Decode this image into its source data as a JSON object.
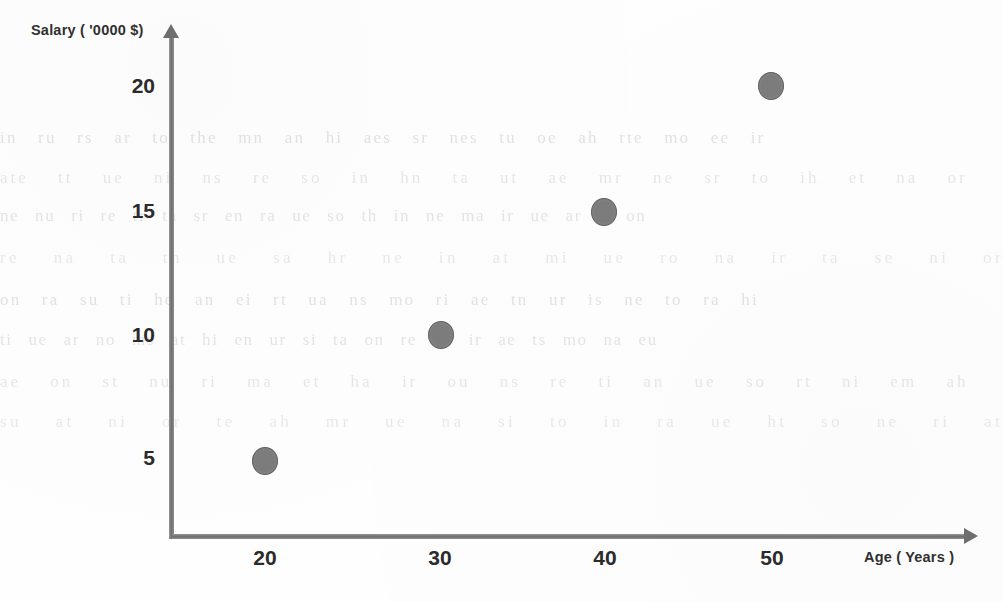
{
  "chart_data": {
    "type": "scatter",
    "title": "",
    "xlabel": "Age ( Years )",
    "ylabel": "Salary ( '0000  $)",
    "x": [
      20,
      30,
      40,
      50
    ],
    "y": [
      5,
      10,
      15,
      20
    ],
    "points": [
      {
        "x": 20,
        "y": 5,
        "px": 265,
        "py": 461
      },
      {
        "x": 30,
        "y": 10,
        "px": 441,
        "py": 335
      },
      {
        "x": 40,
        "y": 15,
        "px": 604,
        "py": 212
      },
      {
        "x": 50,
        "y": 20,
        "px": 771,
        "py": 86
      }
    ],
    "xticks": [
      {
        "label": "20",
        "px": 265
      },
      {
        "label": "30",
        "px": 440
      },
      {
        "label": "40",
        "px": 605
      },
      {
        "label": "50",
        "px": 772
      }
    ],
    "yticks": [
      {
        "label": "20",
        "py": 88
      },
      {
        "label": "15",
        "py": 213
      },
      {
        "label": "10",
        "py": 337
      },
      {
        "label": "5",
        "py": 460
      }
    ],
    "xlim": [
      0,
      58
    ],
    "ylim": [
      0,
      22
    ],
    "grid": false,
    "legend": null,
    "marker_color": "#7c7c7c",
    "marker_edge_color": "#5f5f5f",
    "axis_color": "#6e6e6e",
    "text_color": "#2b2b2b",
    "background": "#fefefe"
  },
  "background_artifacts": {
    "description": "faint scanned bleed-through text",
    "lines": [
      "in  ru  rs   ar  to  the  mn  an   hi  aes  sr  nes  tu   oe  ah  rte  mo  ee  ir",
      "ate   tt   ue  ni  ns   re  so  in  hn  ta   ut  ae  mr  ne  sr  to  ih  et  na  or",
      "ne   nu  ri  re  tr  ta  sr  en   ra  ue  so  th  in  ne  ma  ir  ue  ar   ti  on",
      "re   na  ta  tn  ue  sa  hr  ne   in  at  mi  ue  ro  na  ir  ta  se  ni   or  ut",
      "on  ra  su  ti  he  an  ei  rt   ua  ns  mo  ri  ae  tn  ur  is  ne  to  ra   hi",
      "ti  ue  ar   no  ms  at  hi  en  ur  si  ta  on  re  nu  ir  ae  ts  mo  na  eu",
      "ae  on  st  nu  ri  ma  et  ha   ir  ou  ns  re  ti  an  ue  so  rt  ni  em  ah",
      "su  at  ni  or  te  ah  mr  ue  na  si  to  in  ra  ue  ht  so  ne  ri  at  um"
    ]
  }
}
